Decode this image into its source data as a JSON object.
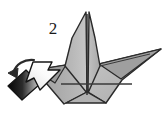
{
  "figure": {
    "background_color": "#ffffff",
    "width": 166,
    "height": 120
  },
  "step_label": {
    "name": "step-number",
    "text": "2",
    "x": 53,
    "y": 33,
    "color": "#1a1a1a"
  },
  "palette": {
    "paper_light": "#c3c3c3",
    "paper_mid": "#b4b4b4",
    "paper_dark": "#9a9a9a",
    "paper_shadow": "#8a8a8a",
    "outline": "#2a2a2a",
    "fold_line": "#3a3a3a",
    "arrow_fill": "#f2f2f2",
    "arrow_outline": "#1c1c1c",
    "arrow_tail_dark": "#0d0d0d",
    "arrow_tail_light": "#d8d8d8",
    "curved_arrow": "#2a2a2a"
  },
  "model": {
    "name": "paper-crane",
    "description": "Folded paper crane seen from the front with two tall center points and two wings",
    "facets": [
      {
        "name": "facet-center-left-peak",
        "shade": "#bdbdbd",
        "points": "86,12 86,92 66,66 72,40"
      },
      {
        "name": "facet-center-right-peak",
        "shade": "#b4b4b4",
        "points": "88,12 94,40 100,66 88,92"
      },
      {
        "name": "facet-left-wing",
        "shade": "#a8a8a8",
        "points": "66,66 86,92 62,104 34,70"
      },
      {
        "name": "facet-right-wing",
        "shade": "#bdbdbd",
        "points": "100,66 160,50 118,84 104,104 88,92"
      },
      {
        "name": "facet-right-wing-under",
        "shade": "#9d9d9d",
        "points": "100,66 160,50 120,78"
      },
      {
        "name": "facet-left-wing-under",
        "shade": "#9a9a9a",
        "points": "34,70 66,66 52,84"
      },
      {
        "name": "facet-body-lower",
        "shade": "#b0b0b0",
        "points": "86,92 104,104 70,104"
      }
    ],
    "fold_lines": [
      {
        "name": "fold-line-center-vertical",
        "x1": 87,
        "y1": 14,
        "x2": 87,
        "y2": 95
      },
      {
        "name": "fold-line-horizontal-crease",
        "x1": 60,
        "y1": 84,
        "x2": 132,
        "y2": 84
      },
      {
        "name": "fold-line-left-wing",
        "x1": 66,
        "y1": 66,
        "x2": 40,
        "y2": 72
      },
      {
        "name": "fold-line-right-wing",
        "x1": 100,
        "y1": 66,
        "x2": 150,
        "y2": 54
      }
    ]
  },
  "arrows": [
    {
      "name": "fold-arrow-block",
      "type": "block-arrow",
      "direction": "up-right",
      "fill": "#f4f4f4",
      "outline": "#1c1c1c",
      "tail_gradient": [
        "#080808",
        "#c9c9c9"
      ],
      "description": "Large white block arrow with dark shaded tail pointing up and to the right"
    },
    {
      "name": "rotate-arrow-curved",
      "type": "curved-arrow",
      "direction": "counter-clockwise",
      "color": "#2a2a2a",
      "description": "Small curved arrow above the block arrow indicating the fold direction"
    }
  ]
}
